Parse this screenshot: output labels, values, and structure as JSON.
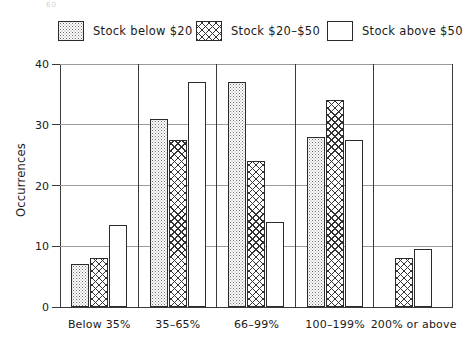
{
  "artifact": {
    "top_left_smudge": "60"
  },
  "legend": {
    "position": "top",
    "items": [
      {
        "label": "Stock below $20",
        "pattern": "dotted-stipple-swatch"
      },
      {
        "label": "Stock  $20–$50",
        "pattern": "crosshatch-swatch"
      },
      {
        "label": "Stock above $50",
        "pattern": "empty-white-swatch"
      }
    ]
  },
  "axes": {
    "ylabel": "Occurrences",
    "ytick_labels": [
      "0",
      "10",
      "20",
      "30",
      "40"
    ],
    "xtick_labels": [
      "Below 35%",
      "35–65%",
      "66–99%",
      "100–199%",
      "200% or above"
    ]
  },
  "chart_data": {
    "type": "bar",
    "title": "",
    "xlabel": "",
    "ylabel": "Occurrences",
    "ylim": [
      0,
      40
    ],
    "yticks": [
      0,
      10,
      20,
      30,
      40
    ],
    "grid": true,
    "legend_position": "top",
    "categories": [
      "Below 35%",
      "35–65%",
      "66–99%",
      "100–199%",
      "200% or above"
    ],
    "series": [
      {
        "name": "Stock below $20",
        "pattern": "dotted",
        "values": [
          7,
          31,
          37,
          28,
          null
        ]
      },
      {
        "name": "Stock $20–$50",
        "pattern": "crosshatch",
        "values": [
          8,
          27.5,
          24,
          34,
          8
        ]
      },
      {
        "name": "Stock above $50",
        "pattern": "empty",
        "values": [
          13.5,
          37,
          14,
          27.5,
          9.5
        ]
      }
    ]
  },
  "colors": {
    "axis": "#3a3a3a",
    "gridline": "#9a9a9a",
    "bar_outline": "#2b2b2b",
    "background": "#ffffff"
  }
}
